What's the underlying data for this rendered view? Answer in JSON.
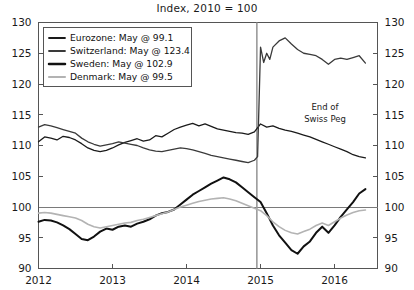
{
  "chart_data": {
    "type": "line",
    "title": "Index, 2010 = 100",
    "xlabel": "",
    "ylabel": "",
    "xlim": [
      2012.0,
      2016.58
    ],
    "ylim": [
      90,
      130
    ],
    "yticks": [
      90,
      95,
      100,
      105,
      110,
      115,
      120,
      125,
      130
    ],
    "xticks": [
      2012,
      2013,
      2014,
      2015,
      2016
    ],
    "xtick_labels": [
      "2012",
      "2013",
      "2014",
      "2015",
      "2016"
    ],
    "grid": false,
    "reference_line_y": 100,
    "dual_y_axis": true,
    "legend_position": "upper-left",
    "annotations": [
      {
        "text_line1": "End of",
        "text_line2": "Swiss Peg",
        "x": 2015.0,
        "vline_x": 2014.95
      }
    ],
    "series": [
      {
        "name": "Eurozone",
        "label": "Eurozone: May @ 99.1",
        "color": "#1a1a1a",
        "width": 1.3,
        "last_value": 99.1,
        "x": [
          2012.0,
          2012.083,
          2012.167,
          2012.25,
          2012.333,
          2012.417,
          2012.5,
          2012.583,
          2012.667,
          2012.75,
          2012.833,
          2012.917,
          2013.0,
          2013.083,
          2013.167,
          2013.25,
          2013.333,
          2013.417,
          2013.5,
          2013.583,
          2013.667,
          2013.75,
          2013.833,
          2013.917,
          2014.0,
          2014.083,
          2014.167,
          2014.25,
          2014.333,
          2014.417,
          2014.5,
          2014.583,
          2014.667,
          2014.75,
          2014.833,
          2014.917,
          2015.0,
          2015.083,
          2015.167,
          2015.25,
          2015.333,
          2015.417,
          2015.5,
          2015.583,
          2015.667,
          2015.75,
          2015.833,
          2015.917,
          2016.0,
          2016.083,
          2016.167,
          2016.25,
          2016.333,
          2016.417
        ],
        "y": [
          110.6,
          111.4,
          111.2,
          110.9,
          111.5,
          111.3,
          110.9,
          110.3,
          109.6,
          109.2,
          109.0,
          109.2,
          109.6,
          110.1,
          110.5,
          110.8,
          111.1,
          110.7,
          110.9,
          111.6,
          111.4,
          112.0,
          112.6,
          113.0,
          113.3,
          113.6,
          113.2,
          113.5,
          113.1,
          112.7,
          112.5,
          112.3,
          112.1,
          112.0,
          111.8,
          112.2,
          113.5,
          113.0,
          113.2,
          112.8,
          112.5,
          112.3,
          112.0,
          111.7,
          111.4,
          111.0,
          110.6,
          110.2,
          109.8,
          109.4,
          109.0,
          108.5,
          108.2,
          108.0
        ]
      },
      {
        "name": "Switzerland",
        "label": "Switzerland: May @ 123.4",
        "color": "#3a3a3a",
        "width": 1.3,
        "last_value": 123.4,
        "x": [
          2012.0,
          2012.083,
          2012.167,
          2012.25,
          2012.333,
          2012.417,
          2012.5,
          2012.583,
          2012.667,
          2012.75,
          2012.833,
          2012.917,
          2013.0,
          2013.083,
          2013.167,
          2013.25,
          2013.333,
          2013.417,
          2013.5,
          2013.583,
          2013.667,
          2013.75,
          2013.833,
          2013.917,
          2014.0,
          2014.083,
          2014.167,
          2014.25,
          2014.333,
          2014.417,
          2014.5,
          2014.583,
          2014.667,
          2014.75,
          2014.833,
          2014.917,
          2014.96,
          2015.0,
          2015.042,
          2015.083,
          2015.125,
          2015.167,
          2015.25,
          2015.333,
          2015.417,
          2015.5,
          2015.583,
          2015.667,
          2015.75,
          2015.833,
          2015.917,
          2016.0,
          2016.083,
          2016.167,
          2016.25,
          2016.333,
          2016.417
        ],
        "y": [
          113.0,
          113.4,
          113.2,
          112.9,
          112.6,
          112.3,
          112.0,
          111.2,
          110.6,
          110.2,
          109.9,
          110.1,
          110.3,
          110.6,
          110.4,
          110.2,
          110.0,
          109.6,
          109.3,
          109.1,
          109.0,
          109.2,
          109.4,
          109.6,
          109.5,
          109.3,
          109.0,
          108.7,
          108.4,
          108.2,
          108.0,
          107.8,
          107.6,
          107.4,
          107.2,
          107.6,
          108.2,
          126.0,
          123.5,
          125.0,
          124.0,
          126.0,
          127.0,
          127.5,
          126.5,
          125.6,
          125.0,
          124.8,
          124.6,
          124.0,
          123.2,
          124.0,
          124.2,
          124.0,
          124.3,
          124.6,
          123.4
        ]
      },
      {
        "name": "Sweden",
        "label": "Sweden: May @ 102.9",
        "color": "#111111",
        "width": 2.0,
        "last_value": 102.9,
        "x": [
          2012.0,
          2012.083,
          2012.167,
          2012.25,
          2012.333,
          2012.417,
          2012.5,
          2012.583,
          2012.667,
          2012.75,
          2012.833,
          2012.917,
          2013.0,
          2013.083,
          2013.167,
          2013.25,
          2013.333,
          2013.417,
          2013.5,
          2013.583,
          2013.667,
          2013.75,
          2013.833,
          2013.917,
          2014.0,
          2014.083,
          2014.167,
          2014.25,
          2014.333,
          2014.417,
          2014.5,
          2014.583,
          2014.667,
          2014.75,
          2014.833,
          2014.917,
          2015.0,
          2015.083,
          2015.167,
          2015.25,
          2015.333,
          2015.417,
          2015.5,
          2015.583,
          2015.667,
          2015.75,
          2015.833,
          2015.917,
          2016.0,
          2016.083,
          2016.167,
          2016.25,
          2016.333,
          2016.417
        ],
        "y": [
          97.6,
          97.9,
          97.8,
          97.5,
          97.0,
          96.4,
          95.6,
          94.8,
          94.6,
          95.2,
          96.0,
          96.5,
          96.3,
          96.8,
          97.0,
          96.8,
          97.3,
          97.6,
          98.0,
          98.6,
          99.0,
          99.2,
          99.6,
          100.4,
          101.2,
          102.0,
          102.6,
          103.2,
          103.8,
          104.3,
          104.8,
          104.5,
          104.0,
          103.2,
          102.4,
          101.6,
          100.8,
          99.0,
          97.0,
          95.4,
          94.2,
          93.0,
          92.4,
          93.6,
          94.4,
          95.8,
          96.8,
          95.8,
          97.0,
          98.4,
          99.6,
          100.8,
          102.2,
          102.9
        ]
      },
      {
        "name": "Denmark",
        "label": "Denmark: May @ 99.5",
        "color": "#b3b3b3",
        "width": 1.6,
        "last_value": 99.5,
        "x": [
          2012.0,
          2012.083,
          2012.167,
          2012.25,
          2012.333,
          2012.417,
          2012.5,
          2012.583,
          2012.667,
          2012.75,
          2012.833,
          2012.917,
          2013.0,
          2013.083,
          2013.167,
          2013.25,
          2013.333,
          2013.417,
          2013.5,
          2013.583,
          2013.667,
          2013.75,
          2013.833,
          2013.917,
          2014.0,
          2014.083,
          2014.167,
          2014.25,
          2014.333,
          2014.417,
          2014.5,
          2014.583,
          2014.667,
          2014.75,
          2014.833,
          2014.917,
          2015.0,
          2015.083,
          2015.167,
          2015.25,
          2015.333,
          2015.417,
          2015.5,
          2015.583,
          2015.667,
          2015.75,
          2015.833,
          2015.917,
          2016.0,
          2016.083,
          2016.167,
          2016.25,
          2016.333,
          2016.417
        ],
        "y": [
          99.0,
          99.1,
          99.0,
          98.8,
          98.6,
          98.4,
          98.2,
          97.8,
          97.2,
          96.8,
          96.6,
          96.8,
          97.0,
          97.2,
          97.4,
          97.5,
          97.8,
          98.0,
          98.3,
          98.6,
          98.9,
          99.2,
          99.6,
          100.0,
          100.3,
          100.6,
          100.9,
          101.1,
          101.3,
          101.4,
          101.5,
          101.3,
          101.0,
          100.6,
          100.2,
          99.8,
          99.4,
          98.6,
          97.6,
          96.8,
          96.2,
          95.8,
          95.6,
          96.0,
          96.4,
          97.0,
          97.4,
          97.0,
          97.6,
          98.2,
          98.7,
          99.1,
          99.4,
          99.5
        ]
      }
    ]
  }
}
